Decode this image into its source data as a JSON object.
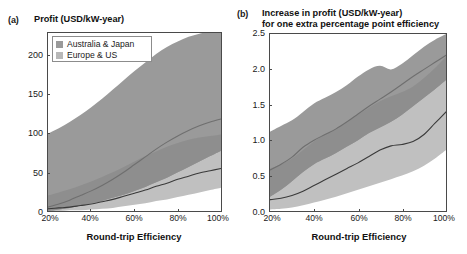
{
  "figure": {
    "background": "#ffffff",
    "axis_color": "#4a4a4a"
  },
  "panels": [
    {
      "tag": "(a)",
      "title_line1": "Profit (USD/kW-year)",
      "title_line2": "",
      "xlabel": "Round-trip Efficiency",
      "ylabel": "",
      "xticks": [
        "20%",
        "40%",
        "60%",
        "80%",
        "100%"
      ],
      "yticks": [
        "0",
        "50",
        "100",
        "150",
        "200"
      ]
    },
    {
      "tag": "(b)",
      "title_line1": "Increase in profit (USD/kW-year)",
      "title_line2": "for one extra percentage point efficiency",
      "xlabel": "Round-trip Efficiency",
      "ylabel": "",
      "xticks": [
        "20%",
        "40%",
        "60%",
        "80%",
        "100%"
      ],
      "yticks": [
        "0.0",
        "0.5",
        "1.0",
        "1.5",
        "2.0",
        "2.5"
      ]
    }
  ],
  "legend": {
    "entries": [
      {
        "label": "Australia & Japan",
        "color": "#9a9a9a"
      },
      {
        "label": "Europe & US",
        "color": "#b8b8b8"
      }
    ]
  },
  "colors": {
    "band_australia_japan": "#9a9a9a",
    "band_europe_us": "#c0c0c0",
    "band_overlap": "#8e8e8e",
    "line_australia_japan": "#6f6f6f",
    "line_europe_us": "#3a3a3a",
    "frame": "#4a4a4a"
  },
  "chart_data": {
    "type": "area",
    "panel_count": 2,
    "charts": [
      {
        "id": "panel-a",
        "type": "area",
        "title": "Profit (USD/kW-year)",
        "xlabel": "Round-trip Efficiency",
        "ylabel": "Profit (USD/kW-year)",
        "xlim": [
          20,
          100
        ],
        "ylim": [
          0,
          230
        ],
        "xticks": [
          20,
          40,
          60,
          80,
          100
        ],
        "yticks": [
          0,
          50,
          100,
          150,
          200
        ],
        "xtick_labels": [
          "20%",
          "40%",
          "60%",
          "80%",
          "100%"
        ],
        "ytick_labels": [
          "0",
          "50",
          "100",
          "150",
          "200"
        ],
        "grid": false,
        "legend_position": "top-left",
        "x": [
          20,
          25,
          30,
          35,
          40,
          45,
          50,
          55,
          60,
          65,
          70,
          75,
          80,
          85,
          90,
          95,
          100
        ],
        "series": [
          {
            "name": "Australia & Japan",
            "kind": "band_with_median",
            "color": "#9a9a9a",
            "line_color": "#6f6f6f",
            "median": [
              5,
              9,
              14,
              20,
              26,
              33,
              41,
              50,
              60,
              70,
              80,
              89,
              97,
              104,
              110,
              115,
              119
            ],
            "lower": [
              0,
              2,
              4,
              7,
              10,
              13,
              17,
              21,
              26,
              31,
              37,
              43,
              50,
              57,
              64,
              71,
              78
            ],
            "upper": [
              100,
              107,
              115,
              124,
              134,
              145,
              157,
              169,
              181,
              192,
              203,
              212,
              219,
              225,
              229,
              232,
              234
            ]
          },
          {
            "name": "Europe & US",
            "kind": "band_with_median",
            "color": "#c0c0c0",
            "line_color": "#3a3a3a",
            "median": [
              3,
              4,
              5,
              7,
              9,
              12,
              15,
              19,
              23,
              27,
              32,
              36,
              41,
              45,
              49,
              52,
              55
            ],
            "lower": [
              0,
              0,
              1,
              1,
              2,
              3,
              4,
              6,
              8,
              10,
              13,
              15,
              18,
              21,
              24,
              27,
              30
            ],
            "upper": [
              20,
              24,
              28,
              33,
              38,
              44,
              50,
              57,
              64,
              71,
              77,
              83,
              88,
              92,
              95,
              97,
              99
            ]
          }
        ]
      },
      {
        "id": "panel-b",
        "type": "area",
        "title": "Increase in profit (USD/kW-year) for one extra percentage point efficiency",
        "xlabel": "Round-trip Efficiency",
        "ylabel": "Increase in profit (USD/kW-year)",
        "xlim": [
          20,
          100
        ],
        "ylim": [
          0.0,
          2.5
        ],
        "xticks": [
          20,
          40,
          60,
          80,
          100
        ],
        "yticks": [
          0.0,
          0.5,
          1.0,
          1.5,
          2.0,
          2.5
        ],
        "xtick_labels": [
          "20%",
          "40%",
          "60%",
          "80%",
          "100%"
        ],
        "ytick_labels": [
          "0.0",
          "0.5",
          "1.0",
          "1.5",
          "2.0",
          "2.5"
        ],
        "grid": false,
        "legend_position": "none",
        "x": [
          20,
          25,
          30,
          35,
          40,
          45,
          50,
          55,
          60,
          65,
          70,
          75,
          80,
          85,
          90,
          95,
          100
        ],
        "series": [
          {
            "name": "Australia & Japan",
            "kind": "band_with_median",
            "color": "#9a9a9a",
            "line_color": "#6f6f6f",
            "median": [
              0.58,
              0.66,
              0.76,
              0.9,
              1.0,
              1.08,
              1.16,
              1.26,
              1.37,
              1.48,
              1.58,
              1.68,
              1.79,
              1.9,
              2.0,
              2.1,
              2.2
            ],
            "lower": [
              0.2,
              0.3,
              0.42,
              0.55,
              0.66,
              0.74,
              0.82,
              0.91,
              1.0,
              1.1,
              1.18,
              1.26,
              1.36,
              1.48,
              1.6,
              1.72,
              1.85
            ],
            "upper": [
              1.12,
              1.2,
              1.28,
              1.4,
              1.52,
              1.6,
              1.68,
              1.78,
              1.9,
              2.0,
              2.05,
              2.0,
              2.08,
              2.2,
              2.32,
              2.42,
              2.5
            ]
          },
          {
            "name": "Europe & US",
            "kind": "band_with_median",
            "color": "#c0c0c0",
            "line_color": "#3a3a3a",
            "median": [
              0.16,
              0.18,
              0.22,
              0.28,
              0.36,
              0.44,
              0.52,
              0.6,
              0.68,
              0.77,
              0.86,
              0.92,
              0.94,
              0.98,
              1.08,
              1.24,
              1.4
            ],
            "lower": [
              0.02,
              0.03,
              0.05,
              0.08,
              0.12,
              0.16,
              0.2,
              0.25,
              0.3,
              0.35,
              0.4,
              0.45,
              0.5,
              0.56,
              0.64,
              0.74,
              0.86
            ],
            "upper": [
              0.6,
              0.66,
              0.74,
              0.86,
              0.98,
              1.08,
              1.16,
              1.26,
              1.36,
              1.46,
              1.55,
              1.62,
              1.68,
              1.76,
              1.88,
              2.02,
              2.18
            ]
          }
        ]
      }
    ]
  }
}
